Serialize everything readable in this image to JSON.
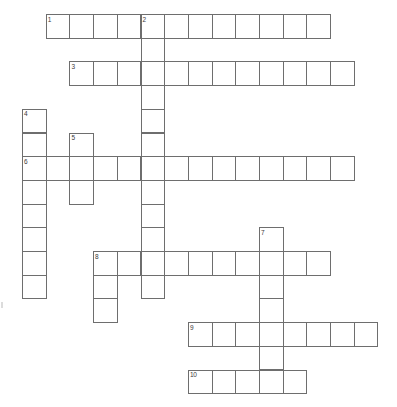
{
  "puzzle": {
    "title": "Crossword Puzzle Grid",
    "kind": "blank-crossword-grid",
    "grid": {
      "origin_x": 22,
      "origin_y": 14,
      "cell_size": 23.7,
      "cols": 15,
      "rows": 16,
      "line_color": "#6e6e6e",
      "cell_fill": "#ffffff",
      "background": "#ffffff",
      "number_color": "#3a3a3a"
    },
    "entries": [
      {
        "number": "1",
        "direction": "across",
        "row": 0,
        "col": 1,
        "length": 12,
        "letters": ""
      },
      {
        "number": "2",
        "direction": "down",
        "row": 0,
        "col": 5,
        "length": 12,
        "letters": ""
      },
      {
        "number": "3",
        "direction": "across",
        "row": 2,
        "col": 2,
        "length": 12,
        "letters": ""
      },
      {
        "number": "4",
        "direction": "down",
        "row": 4,
        "col": 0,
        "length": 8,
        "letters": ""
      },
      {
        "number": "5",
        "direction": "down",
        "row": 5,
        "col": 2,
        "length": 3,
        "letters": ""
      },
      {
        "number": "6",
        "direction": "across",
        "row": 6,
        "col": 0,
        "length": 14,
        "letters": ""
      },
      {
        "number": "7",
        "direction": "down",
        "row": 9,
        "col": 10,
        "length": 7,
        "letters": ""
      },
      {
        "number": "8",
        "direction": "across",
        "row": 10,
        "col": 3,
        "length": 10,
        "letters": ""
      },
      {
        "number": "8",
        "direction": "down",
        "row": 10,
        "col": 3,
        "length": 3,
        "letters": ""
      },
      {
        "number": "9",
        "direction": "across",
        "row": 13,
        "col": 7,
        "length": 8,
        "letters": ""
      },
      {
        "number": "10",
        "direction": "across",
        "row": 15,
        "col": 7,
        "length": 5,
        "letters": ""
      }
    ],
    "numbered_labels": [
      {
        "label": "1",
        "row": 0,
        "col": 1
      },
      {
        "label": "2",
        "row": 0,
        "col": 5
      },
      {
        "label": "3",
        "row": 2,
        "col": 2
      },
      {
        "label": "4",
        "row": 4,
        "col": 0
      },
      {
        "label": "5",
        "row": 5,
        "col": 2
      },
      {
        "label": "6",
        "row": 6,
        "col": 0
      },
      {
        "label": "7",
        "row": 9,
        "col": 10
      },
      {
        "label": "8",
        "row": 10,
        "col": 3
      },
      {
        "label": "9",
        "row": 13,
        "col": 7
      },
      {
        "label": "10",
        "row": 15,
        "col": 7
      }
    ]
  }
}
